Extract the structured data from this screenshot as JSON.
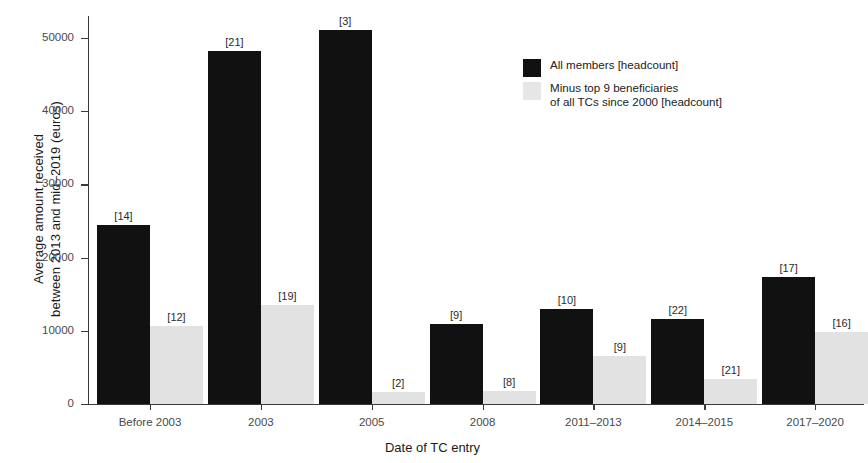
{
  "chart_data": {
    "type": "bar",
    "title": "",
    "xlabel": "Date of TC entry",
    "ylabel": "Average amount received\nbetween 2013 and mid–2019 (euros)",
    "categories": [
      "Before 2003",
      "2003",
      "2005",
      "2008",
      "2011–2013",
      "2014–2015",
      "2017–2020"
    ],
    "ylim": [
      0,
      53000
    ],
    "yticks": [
      0,
      10000,
      20000,
      30000,
      40000,
      50000
    ],
    "ytick_labels": [
      "0",
      "10000",
      "20000",
      "30000",
      "40000",
      "50000"
    ],
    "grid": false,
    "legend_position": "upper right",
    "series": [
      {
        "name": "All members [headcount]",
        "color": "#111111",
        "values": [
          24400,
          48200,
          51100,
          10900,
          13000,
          11600,
          17300
        ],
        "point_labels": [
          "[14]",
          "[21]",
          "[3]",
          "[9]",
          "[10]",
          "[22]",
          "[17]"
        ]
      },
      {
        "name": "Minus top 9 beneficiaries\n of all TCs since 2000 [headcount]",
        "color": "#e2e2e2",
        "values": [
          10700,
          13500,
          1600,
          1800,
          6600,
          3400,
          9900
        ],
        "point_labels": [
          "[12]",
          "[19]",
          "[2]",
          "[8]",
          "[9]",
          "[21]",
          "[16]"
        ]
      }
    ]
  },
  "legend": {
    "entries": [
      {
        "label": "All members [headcount]",
        "swatch": "#111111"
      },
      {
        "label": "Minus top 9 beneficiaries\n of all TCs since 2000 [headcount]",
        "swatch": "#e6e6e6"
      }
    ]
  },
  "axes": {
    "x_title": "Date of TC entry",
    "y_title": "Average amount received\nbetween 2013 and mid–2019 (euros)"
  }
}
